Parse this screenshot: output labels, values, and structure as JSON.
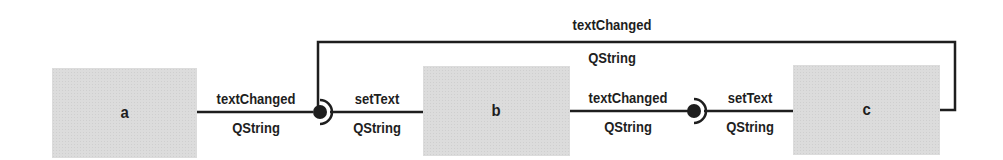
{
  "diagram": {
    "type": "signal-slot-connections",
    "colors": {
      "line": "#1e1e1e",
      "box_fill": "#dcdcdc",
      "text": "#1e1e1e",
      "background": "#ffffff"
    },
    "objects": [
      {
        "id": "a",
        "label": "a"
      },
      {
        "id": "b",
        "label": "b"
      },
      {
        "id": "c",
        "label": "c"
      }
    ],
    "connections": [
      {
        "from": "a",
        "to": "b",
        "signal": "textChanged",
        "signal_type": "QString",
        "slot": "setText",
        "slot_type": "QString"
      },
      {
        "from": "b",
        "to": "c",
        "signal": "textChanged",
        "signal_type": "QString",
        "slot": "setText",
        "slot_type": "QString"
      },
      {
        "from": "c",
        "to": "b",
        "signal": "textChanged",
        "signal_type": "QString",
        "route": "loop-over-top"
      }
    ]
  }
}
